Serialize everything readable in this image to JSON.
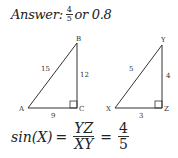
{
  "answer": {
    "prefix": "Answer:",
    "fraction_num": "4",
    "fraction_den": "5",
    "suffix": "or 0.8"
  },
  "triangle_abc": {
    "vertices": {
      "A": "A",
      "B": "B",
      "C": "C"
    },
    "sides": {
      "AB": "15",
      "BC": "12",
      "AC": "9"
    },
    "right_angle_at": "C"
  },
  "triangle_xyz": {
    "vertices": {
      "X": "X",
      "Y": "Y",
      "Z": "Z"
    },
    "sides": {
      "XY": "5",
      "YZ": "4",
      "XZ": "3"
    },
    "right_angle_at": "Z"
  },
  "equation": {
    "lhs": "sin(X)",
    "equals": "=",
    "ratio_num": "YZ",
    "ratio_den": "XY",
    "value_num": "4",
    "value_den": "5"
  }
}
